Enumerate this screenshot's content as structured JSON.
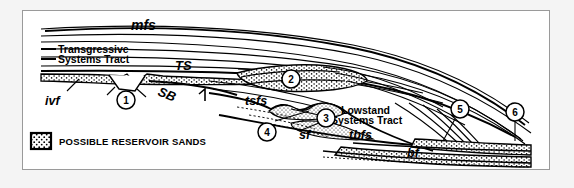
{
  "figure": {
    "type": "sequence-stratigraphic-cross-section",
    "background_color": "#f4f4f4",
    "panel_color": "#ffffff",
    "border_color": "#9a9a9a",
    "ink_color": "#000000"
  },
  "labels": {
    "mfs": "mfs",
    "transgressive_line1": "Transgressive",
    "transgressive_line2": "Systems Tract",
    "ts": "TS",
    "sb": "SB",
    "ivf": "ivf",
    "tsfs": "tsfs",
    "lowstand_line1": "Lowstand",
    "lowstand_line2": "Systems Tract",
    "tbfs": "tbfs",
    "sf": "sf",
    "bf": "bf"
  },
  "callouts": [
    {
      "id": "1",
      "number": "1"
    },
    {
      "id": "2",
      "number": "2"
    },
    {
      "id": "3",
      "number": "3"
    },
    {
      "id": "4",
      "number": "4"
    },
    {
      "id": "5",
      "number": "5"
    },
    {
      "id": "6",
      "number": "6"
    }
  ],
  "legend": {
    "swatch_name": "stippled-sand-pattern",
    "text": "POSSIBLE RESERVOIR SANDS"
  }
}
